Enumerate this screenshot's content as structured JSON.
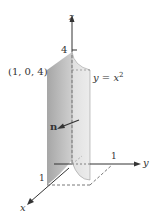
{
  "figure": {
    "labels": {
      "z_axis": "z",
      "y_axis": "y",
      "x_axis": "x",
      "z_tick": "4",
      "y_tick": "1",
      "x_tick": "1",
      "point": "(1, 0, 4)",
      "surface_eq_prefix": "y = x",
      "surface_eq_exp": "2",
      "normal": "n"
    },
    "colors": {
      "dark_face": "#a9a9a9",
      "light_face": "#e4e4e4",
      "axis": "#333333",
      "dashed": "#666666"
    }
  }
}
